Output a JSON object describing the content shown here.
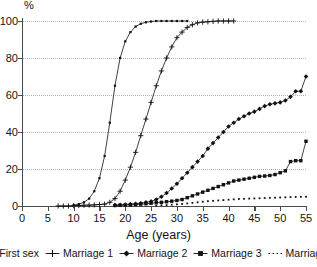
{
  "chart_data": {
    "type": "line",
    "title": "",
    "subtitle": "",
    "xlabel": "Age (years)",
    "ylabel": "%",
    "y_unit_label": "%",
    "xlim": [
      0,
      55
    ],
    "ylim": [
      0,
      100
    ],
    "grid": true,
    "grid_axis": "y",
    "grid_style": "dotted",
    "legend_position": "bottom",
    "x_ticks": [
      0,
      5,
      10,
      15,
      20,
      25,
      30,
      35,
      40,
      45,
      50,
      55
    ],
    "y_ticks": [
      0,
      20,
      40,
      60,
      80,
      100
    ],
    "x_tick_labels": [
      "0",
      "5",
      "10",
      "15",
      "20",
      "25",
      "30",
      "35",
      "40",
      "45",
      "50",
      "55"
    ],
    "y_tick_labels": [
      "0",
      "20",
      "40",
      "60",
      "80",
      "100"
    ],
    "series": [
      {
        "name": "First sex",
        "marker": "small-square",
        "line": "solid",
        "x": [
          10,
          11,
          12,
          13,
          14,
          15,
          16,
          17,
          18,
          19,
          20,
          21,
          22,
          23,
          24,
          25,
          26,
          27,
          28,
          29,
          30,
          31,
          32
        ],
        "values": [
          0.5,
          1,
          2,
          4,
          8,
          15,
          27,
          45,
          65,
          80,
          89,
          94,
          97,
          98.5,
          99.3,
          99.7,
          100,
          100,
          100,
          100,
          100,
          100,
          100
        ]
      },
      {
        "name": "Marriage 1",
        "marker": "plus",
        "line": "solid",
        "x": [
          7,
          8,
          9,
          10,
          11,
          12,
          13,
          14,
          15,
          16,
          17,
          18,
          19,
          20,
          21,
          22,
          23,
          24,
          25,
          26,
          27,
          28,
          29,
          30,
          31,
          32,
          33,
          34,
          35,
          36,
          37,
          38,
          39,
          40,
          41
        ],
        "values": [
          0,
          0,
          0,
          0.2,
          0.3,
          0.4,
          0.5,
          0.6,
          0.8,
          1,
          2,
          4,
          8,
          14,
          21,
          29,
          38,
          47,
          56,
          65,
          73,
          80,
          86,
          91,
          94,
          96.5,
          98,
          99,
          99.4,
          99.6,
          99.8,
          100,
          100,
          100,
          100
        ]
      },
      {
        "name": "Marriage 2",
        "marker": "diamond",
        "line": "solid",
        "x": [
          18,
          19,
          20,
          21,
          22,
          23,
          24,
          25,
          26,
          27,
          28,
          29,
          30,
          31,
          32,
          33,
          34,
          35,
          36,
          37,
          38,
          39,
          40,
          41,
          42,
          43,
          44,
          45,
          46,
          47,
          48,
          49,
          50,
          51,
          52,
          53,
          54,
          55
        ],
        "values": [
          0.5,
          0.6,
          0.8,
          1,
          1.2,
          1.5,
          2,
          2.5,
          3.5,
          5,
          7,
          9.5,
          12,
          15,
          18,
          21,
          24,
          27,
          31,
          34,
          37,
          40,
          43,
          45,
          47,
          48.5,
          50,
          51,
          52.5,
          54,
          55,
          55.5,
          56,
          57,
          59,
          62,
          62,
          70
        ]
      },
      {
        "name": "Marriage 3",
        "marker": "square",
        "line": "solid",
        "x": [
          18,
          19,
          20,
          21,
          22,
          23,
          24,
          25,
          26,
          27,
          28,
          29,
          30,
          31,
          32,
          33,
          34,
          35,
          36,
          37,
          38,
          39,
          40,
          41,
          42,
          43,
          44,
          45,
          46,
          47,
          48,
          49,
          50,
          51,
          52,
          53,
          54,
          55
        ],
        "values": [
          0.3,
          0.4,
          0.5,
          0.6,
          0.8,
          1,
          1.2,
          1.5,
          1.8,
          2,
          2.3,
          2.6,
          3,
          3.5,
          4.5,
          5.5,
          6.5,
          7.5,
          8.5,
          9.5,
          10.5,
          11.5,
          12.5,
          13.5,
          14,
          14.5,
          15,
          15.5,
          16,
          16.2,
          16.5,
          17,
          18,
          19,
          24,
          24.5,
          24.5,
          35
        ]
      },
      {
        "name": "Marriage 4",
        "marker": "dot",
        "line": "dotted",
        "x": [
          26,
          27,
          28,
          29,
          30,
          31,
          32,
          33,
          34,
          35,
          36,
          37,
          38,
          39,
          40,
          41,
          42,
          43,
          44,
          45,
          46,
          47,
          48,
          49,
          50,
          51,
          52,
          53,
          54,
          55
        ],
        "values": [
          0.3,
          0.4,
          0.5,
          0.7,
          0.9,
          1.1,
          1.4,
          1.7,
          2.0,
          2.3,
          2.6,
          2.8,
          3.0,
          3.2,
          3.4,
          3.6,
          3.8,
          3.9,
          4.0,
          4.1,
          4.2,
          4.3,
          4.4,
          4.5,
          4.6,
          4.7,
          4.8,
          4.9,
          5.0,
          5.0
        ]
      }
    ]
  },
  "legend": {
    "items": [
      {
        "label": "First sex",
        "marker": "small-square"
      },
      {
        "label": "Marriage 1",
        "marker": "plus"
      },
      {
        "label": "Marriage 2",
        "marker": "diamond"
      },
      {
        "label": "Marriage 3",
        "marker": "square"
      },
      {
        "label": "Marriage 4",
        "marker": "dot"
      }
    ]
  },
  "colors": {
    "ink": "#111111",
    "axis": "#4a4a4a",
    "grid": "#b4b4b4",
    "background": "#ffffff"
  }
}
